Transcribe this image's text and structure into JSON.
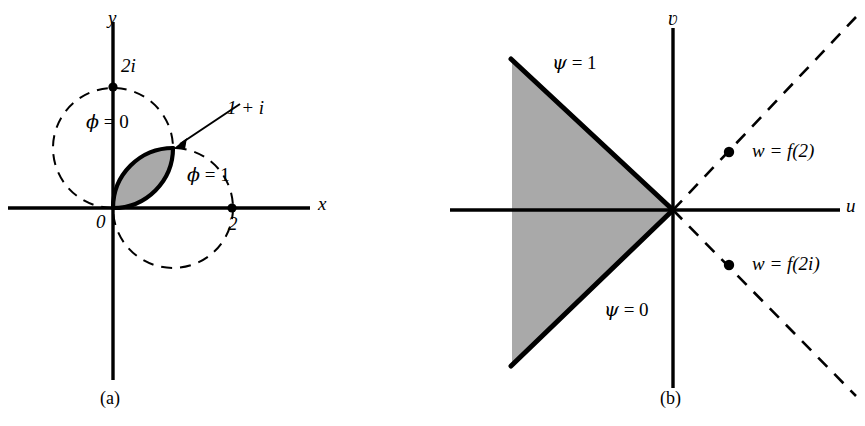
{
  "figure": {
    "background_color": "#ffffff",
    "ink_color": "#000000",
    "shade_color": "#a8a8a8"
  },
  "panels": [
    {
      "id": "a",
      "caption": "(a)",
      "plane": "z-plane",
      "axes": {
        "x_label": "x",
        "y_label": "y",
        "origin_label": "0"
      },
      "marked_points": [
        {
          "label": "2i",
          "desc": "point-2i-on-imaginary-axis"
        },
        {
          "label": "2",
          "desc": "point-2-on-real-axis"
        },
        {
          "label": "1 + i",
          "desc": "point-1-plus-i-lens-corner"
        }
      ],
      "boundary_labels": [
        {
          "label_greek": "φ",
          "label_rest": " = 0",
          "full": "φ = 0"
        },
        {
          "label_greek": "φ",
          "label_rest": " = 1",
          "full": "φ = 1"
        }
      ],
      "shaded_region": "lens-shaped intersection of two dashed circles",
      "dashed_circles": [
        {
          "desc": "circle-through-0-and-2i-centered-left",
          "center": [
            0,
            1
          ],
          "radius": 1
        },
        {
          "desc": "circle-through-0-and-2-centered-below",
          "center": [
            1,
            0
          ],
          "radius": 1
        }
      ]
    },
    {
      "id": "b",
      "caption": "(b)",
      "plane": "w-plane",
      "axes": {
        "u_label": "u",
        "v_label": "ʋ"
      },
      "boundary_labels": [
        {
          "label_greek": "ψ",
          "label_rest": " = 1",
          "full": "ψ = 1"
        },
        {
          "label_greek": "ψ",
          "label_rest": " = 0",
          "full": "ψ = 0"
        }
      ],
      "marked_points": [
        {
          "label": "w = f(2)",
          "desc": "image-of-2-on-upper-dashed-ray"
        },
        {
          "label": "w = f(2i)",
          "desc": "image-of-2i-on-lower-dashed-ray"
        }
      ],
      "shaded_region": "left-opening wedge bounded by the two solid rays",
      "dashed_rays": [
        {
          "desc": "upper-right-dashed-ray-45deg"
        },
        {
          "desc": "lower-right-dashed-ray-minus-45deg"
        }
      ]
    }
  ]
}
